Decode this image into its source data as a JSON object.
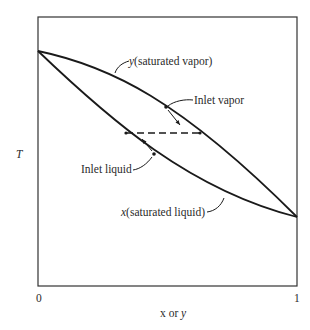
{
  "diagram": {
    "type": "T-x-y phase diagram (binary vapor-liquid equilibrium)",
    "axis": {
      "y_label": "T",
      "x_label_var1": "x",
      "x_label_or": " or ",
      "x_label_var2": "y",
      "x_min_tick": "0",
      "x_max_tick": "1"
    },
    "curves": {
      "vapor": {
        "var": "y",
        "label": "(saturated vapor)"
      },
      "liquid": {
        "var": "x",
        "label": "(saturated liquid)"
      }
    },
    "annotations": {
      "inlet_vapor": "Inlet vapor",
      "inlet_liquid": "Inlet liquid"
    },
    "tie_line": {
      "style": "dashed"
    },
    "colors": {
      "line": "#1a1a1a",
      "frame": "#333333",
      "text": "#2a2a2a"
    }
  }
}
